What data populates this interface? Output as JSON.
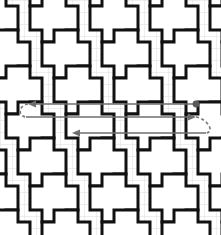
{
  "figure": {
    "width": 221,
    "height": 235,
    "background_color": "#ffffff"
  },
  "colors": {
    "background": "#ffffff",
    "grid_line": "#e3e3e3",
    "tile_stroke": "#111111",
    "tile_fill": "#ffffff",
    "path_arrow": "#6e6e6e",
    "path_marker": "#5a5a5a",
    "path_dashed": "#7a7a7a"
  },
  "grid": {
    "cell_size": 12,
    "columns": 19,
    "rows": 20,
    "visible": true,
    "line_width": 0.6
  },
  "tiling": {
    "type": "greek-cross",
    "shape_name": "plus-pentomino",
    "arm_length": 12,
    "arm_width": 24,
    "cross_extent": 48,
    "stroke_width": 3,
    "lattice_step_x": 60,
    "lattice_step_y": 60,
    "row_offset_x": 24,
    "row_offset_y": 36,
    "origin_x": -18,
    "origin_y": -18,
    "cross_count_x": 6,
    "cross_count_y": 7
  },
  "path": {
    "name": "serpentine-scan-path",
    "direction_sequence": [
      "left",
      "right",
      "left"
    ],
    "segments": [
      {
        "id": "segment-1",
        "label": "pass-1",
        "direction": "left",
        "y": 104,
        "x_start": 196,
        "x_end": 28,
        "arrowhead": "start"
      },
      {
        "id": "segment-2",
        "label": "pass-2",
        "direction": "right",
        "y": 117,
        "x_start": 26,
        "x_end": 196,
        "arrowhead": "end"
      },
      {
        "id": "segment-3",
        "label": "pass-3",
        "direction": "left",
        "y": 133,
        "x_start": 206,
        "x_end": 72,
        "arrowhead": "end"
      }
    ],
    "start_marker": {
      "id": "path-start-dot",
      "x": 196,
      "y": 104,
      "radius": 3.4
    },
    "connectors": [
      {
        "id": "connector-left",
        "side": "left",
        "style": "dashed",
        "from_x": 28,
        "from_y": 104,
        "to_x": 26,
        "to_y": 117
      },
      {
        "id": "connector-right",
        "side": "right",
        "style": "dashed",
        "from_x": 196,
        "from_y": 117,
        "to_x": 206,
        "to_y": 133
      }
    ],
    "stroke_width": 1.7,
    "dash_pattern": "3,2.6",
    "arrowhead_length": 8,
    "arrowhead_width": 7
  }
}
